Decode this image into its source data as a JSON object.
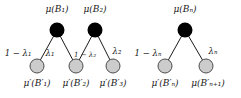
{
  "figure": {
    "type": "graph-diagram",
    "background_color": "#ffffff",
    "node_colors": {
      "parent_fill": "#000000",
      "child_fill": "#cccccc",
      "child_stroke": "#4d4d4d",
      "edge_stroke": "#1a1a1a"
    }
  },
  "clusters": [
    {
      "name": "left-cluster",
      "parents": [
        {
          "id": "B1",
          "label": "μ(B₁)",
          "cx": 57,
          "cy": 30,
          "r": 7.5,
          "label_x": 57,
          "label_y": 5
        },
        {
          "id": "B2",
          "label": "μ(B₂)",
          "cx": 95,
          "cy": 30,
          "r": 7.5,
          "label_x": 95,
          "label_y": 5
        }
      ],
      "children": [
        {
          "id": "Bp1",
          "label": "μ′(B′₁)",
          "cx": 37,
          "cy": 66,
          "r": 7,
          "label_x": 37,
          "label_y": 79
        },
        {
          "id": "Bp2",
          "label": "μ′(B′₂)",
          "cx": 76,
          "cy": 66,
          "r": 7,
          "label_x": 76,
          "label_y": 79
        },
        {
          "id": "Bp3",
          "label": "μ′(B′₃)",
          "cx": 113,
          "cy": 66,
          "r": 7,
          "label_x": 113,
          "label_y": 79
        }
      ],
      "edges": [
        {
          "from": "B1",
          "to": "Bp1",
          "label": "1 − λ₁",
          "label_x": 18,
          "label_y": 49
        },
        {
          "from": "B1",
          "to": "Bp2",
          "label": "λ₁",
          "label_x": 50,
          "label_y": 49
        },
        {
          "from": "B2",
          "to": "Bp2",
          "label": "1 − λ₂",
          "label_x": 85,
          "label_y": 52
        },
        {
          "from": "B2",
          "to": "Bp3",
          "label": "λ₂",
          "label_x": 117,
          "label_y": 47
        }
      ]
    },
    {
      "name": "right-cluster",
      "parents": [
        {
          "id": "Bn",
          "label": "μ(Bₙ)",
          "cx": 185,
          "cy": 30,
          "r": 7.5,
          "label_x": 185,
          "label_y": 5
        }
      ],
      "children": [
        {
          "id": "Bpn",
          "label": "μ′(B′ₙ)",
          "cx": 165,
          "cy": 66,
          "r": 7,
          "label_x": 165,
          "label_y": 79
        },
        {
          "id": "Bpn1",
          "label": "μ(B′ₙ₊₁)",
          "cx": 206,
          "cy": 66,
          "r": 7,
          "label_x": 208,
          "label_y": 79
        }
      ],
      "edges": [
        {
          "from": "Bn",
          "to": "Bpn",
          "label": "1 − λₙ",
          "label_x": 148,
          "label_y": 49
        },
        {
          "from": "Bn",
          "to": "Bpn1",
          "label": "λₙ",
          "label_x": 213,
          "label_y": 47
        }
      ]
    }
  ]
}
